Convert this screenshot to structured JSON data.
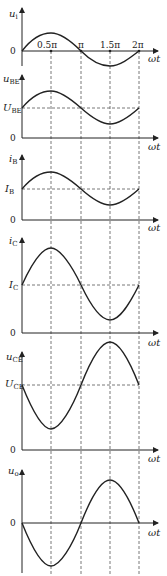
{
  "figure": {
    "x_axis_label": "ωt",
    "ticks": [
      "0.5π",
      "π",
      "1.5π",
      "2π"
    ],
    "panels": [
      {
        "id": "ui",
        "var": "u",
        "sub": "i",
        "zero_label": "0",
        "dc_label": null
      },
      {
        "id": "ube",
        "var": "u",
        "sub": "BE",
        "zero_label": "0",
        "dc_var": "U",
        "dc_sub": "BE"
      },
      {
        "id": "ib",
        "var": "i",
        "sub": "B",
        "zero_label": "0",
        "dc_var": "I",
        "dc_sub": "B"
      },
      {
        "id": "ic",
        "var": "i",
        "sub": "C",
        "zero_label": "0",
        "dc_var": "I",
        "dc_sub": "C"
      },
      {
        "id": "uce",
        "var": "u",
        "sub": "CE",
        "zero_label": "0",
        "dc_var": "U",
        "dc_sub": "CE"
      },
      {
        "id": "uo",
        "var": "u",
        "sub": "o",
        "zero_label": "0",
        "dc_label": null
      }
    ]
  }
}
